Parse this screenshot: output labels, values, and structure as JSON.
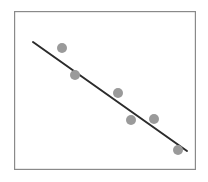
{
  "figure": {
    "title": "",
    "background_color": "#ffffff",
    "width": 208,
    "height": 182
  },
  "plot_frame": {
    "x": 14,
    "y": 11,
    "width": 182,
    "height": 159,
    "border_color": "#8a8a8a",
    "border_width": 1.2,
    "fill_color": "#ffffff"
  },
  "marker_style": {
    "color": "#9a9a9a",
    "radius": 5,
    "shape": "circle"
  },
  "trendline_style": {
    "color": "#2b2b2b",
    "width": 2,
    "dash": "solid"
  },
  "chart_data": {
    "type": "scatter",
    "title": "",
    "subtitle": "",
    "xlabel": "",
    "ylabel": "",
    "xlim": [
      0,
      10
    ],
    "ylim": [
      0,
      10
    ],
    "grid": false,
    "legend": null,
    "axis_ticks": {
      "x": [],
      "y": []
    },
    "annotations": [],
    "series": [
      {
        "name": "observations",
        "type": "scatter",
        "marker_color": "#9a9a9a",
        "points": [
          {
            "px": 62,
            "py": 48,
            "x": 2.6,
            "y": 7.8
          },
          {
            "px": 75,
            "py": 75,
            "x": 3.4,
            "y": 6.0
          },
          {
            "px": 118,
            "py": 93,
            "x": 5.7,
            "y": 4.8
          },
          {
            "px": 131,
            "py": 120,
            "x": 6.4,
            "y": 3.1
          },
          {
            "px": 154,
            "py": 119,
            "x": 7.7,
            "y": 3.2
          },
          {
            "px": 178,
            "py": 150,
            "x": 9.0,
            "y": 1.2
          }
        ]
      },
      {
        "name": "trendline",
        "type": "line",
        "line_color": "#2b2b2b",
        "points": [
          {
            "px": 33,
            "py": 42,
            "x": 1.0,
            "y": 8.2
          },
          {
            "px": 187,
            "py": 151,
            "x": 9.5,
            "y": 1.2
          }
        ],
        "slope_sign": "negative"
      }
    ]
  }
}
